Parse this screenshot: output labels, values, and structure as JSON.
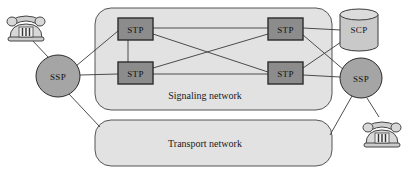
{
  "diagram": {
    "background_color": "#ffffff",
    "containers": [
      {
        "id": "signaling",
        "label": "Signaling network",
        "fill": "#e2e2e2",
        "stroke": "#555555",
        "x": 95,
        "y": 8,
        "width": 237,
        "height": 102,
        "radius": 16,
        "label_x": 205,
        "label_y": 99
      },
      {
        "id": "transport",
        "label": "Transport network",
        "fill": "#e2e2e2",
        "stroke": "#555555",
        "x": 95,
        "y": 120,
        "width": 237,
        "height": 46,
        "radius": 16,
        "label_x": 205,
        "label_y": 147
      }
    ],
    "stp_nodes": [
      {
        "id": "stp-top-left",
        "label": "STP",
        "x": 118,
        "y": 18,
        "width": 35,
        "height": 22,
        "fill": "#8c8c8c",
        "stroke": "#2b2b2b"
      },
      {
        "id": "stp-bottom-left",
        "label": "STP",
        "x": 118,
        "y": 62,
        "width": 35,
        "height": 22,
        "fill": "#8c8c8c",
        "stroke": "#2b2b2b"
      },
      {
        "id": "stp-top-right",
        "label": "STP",
        "x": 268,
        "y": 18,
        "width": 35,
        "height": 22,
        "fill": "#8c8c8c",
        "stroke": "#2b2b2b"
      },
      {
        "id": "stp-bottom-right",
        "label": "STP",
        "x": 268,
        "y": 62,
        "width": 35,
        "height": 22,
        "fill": "#8c8c8c",
        "stroke": "#2b2b2b"
      }
    ],
    "ssp_nodes": [
      {
        "id": "ssp-left",
        "label": "SSP",
        "cx": 58,
        "cy": 76,
        "rx": 22,
        "ry": 21,
        "fill": "#a5a5a5",
        "stroke": "#2b2b2b"
      },
      {
        "id": "ssp-right",
        "label": "SSP",
        "cx": 361,
        "cy": 78,
        "rx": 21,
        "ry": 20,
        "fill": "#a5a5a5",
        "stroke": "#2b2b2b"
      }
    ],
    "scp_node": {
      "id": "scp",
      "label": "SCP",
      "cx": 359,
      "cy": 30,
      "rx": 19,
      "ry": 20,
      "ellipse_ry": 5.5,
      "fill": "#c9c9c9",
      "stroke": "#3a3a3a"
    },
    "phones": [
      {
        "id": "phone-left",
        "x": 6,
        "y": 10,
        "width": 40,
        "height": 32,
        "fill": "#d4d4d4",
        "stroke": "#444444"
      },
      {
        "id": "phone-right",
        "x": 362,
        "y": 116,
        "width": 40,
        "height": 32,
        "fill": "#d4d4d4",
        "stroke": "#444444"
      }
    ],
    "links": [
      {
        "id": "link-phone-left-ssp-left",
        "x1": 32,
        "y1": 40,
        "x2": 49,
        "y2": 58
      },
      {
        "id": "link-ssp-left-stp-top-left",
        "x1": 76,
        "y1": 66,
        "x2": 118,
        "y2": 31
      },
      {
        "id": "link-ssp-left-stp-bot-left",
        "x1": 80,
        "y1": 75,
        "x2": 118,
        "y2": 74
      },
      {
        "id": "link-ssp-left-transport",
        "x1": 69,
        "y1": 94,
        "x2": 100,
        "y2": 127
      },
      {
        "id": "link-stp-tl-stp-tr",
        "x1": 153,
        "y1": 28,
        "x2": 268,
        "y2": 28
      },
      {
        "id": "link-stp-bl-stp-br",
        "x1": 153,
        "y1": 74,
        "x2": 268,
        "y2": 74
      },
      {
        "id": "link-stp-tl-stp-br",
        "x1": 153,
        "y1": 34,
        "x2": 268,
        "y2": 72
      },
      {
        "id": "link-stp-bl-stp-tr",
        "x1": 153,
        "y1": 68,
        "x2": 268,
        "y2": 34
      },
      {
        "id": "link-stp-tl-stp-bl",
        "x1": 128,
        "y1": 40,
        "x2": 128,
        "y2": 62
      },
      {
        "id": "link-stp-tr-scp",
        "x1": 303,
        "y1": 28,
        "x2": 341,
        "y2": 30
      },
      {
        "id": "link-stp-tr-ssp-right",
        "x1": 303,
        "y1": 35,
        "x2": 344,
        "y2": 70
      },
      {
        "id": "link-stp-br-scp",
        "x1": 303,
        "y1": 68,
        "x2": 344,
        "y2": 40
      },
      {
        "id": "link-stp-br-ssp-right",
        "x1": 303,
        "y1": 75,
        "x2": 340,
        "y2": 77
      },
      {
        "id": "link-ssp-right-phone-right",
        "x1": 367,
        "y1": 98,
        "x2": 379,
        "y2": 117
      },
      {
        "id": "link-ssp-right-transport",
        "x1": 352,
        "y1": 96,
        "x2": 330,
        "y2": 135
      }
    ]
  }
}
